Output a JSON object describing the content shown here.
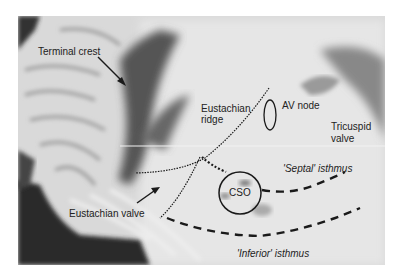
{
  "figure": {
    "background_color": "#ffffff",
    "photo": {
      "x": 18,
      "y": 16,
      "width": 367,
      "height": 249
    },
    "labels": [
      {
        "id": "terminal-crest",
        "text": "Terminal crest",
        "x": 38,
        "y": 46,
        "italic": false
      },
      {
        "id": "eustachian-ridge-1",
        "text": "Eustachian",
        "x": 201,
        "y": 103,
        "italic": false
      },
      {
        "id": "eustachian-ridge-2",
        "text": "ridge",
        "x": 201,
        "y": 113,
        "italic": false
      },
      {
        "id": "av-node",
        "text": "AV node",
        "x": 282,
        "y": 100,
        "italic": false
      },
      {
        "id": "tricuspid-1",
        "text": "Tricuspid",
        "x": 331,
        "y": 121,
        "italic": false
      },
      {
        "id": "tricuspid-2",
        "text": "valve",
        "x": 331,
        "y": 132,
        "italic": false
      },
      {
        "id": "septal-isthmus",
        "text": "'Septal' isthmus",
        "x": 283,
        "y": 168,
        "italic": true
      },
      {
        "id": "cso",
        "text": "CSO",
        "x": 229,
        "y": 187,
        "italic": false
      },
      {
        "id": "eustachian-valve",
        "text": "Eustachian valve",
        "x": 69,
        "y": 208,
        "italic": false
      },
      {
        "id": "inferior-isthmus",
        "text": "'Inferior' isthmus",
        "x": 237,
        "y": 248,
        "italic": true
      }
    ],
    "annotation_color": "#1a1a1a"
  }
}
